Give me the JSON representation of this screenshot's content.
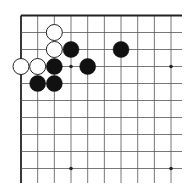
{
  "board": {
    "description": "Go board, top-left corner fragment",
    "origin_x": 21,
    "origin_y": 15.5,
    "spacing_x": 16.67,
    "spacing_y": 17,
    "cols": 10,
    "rows": 10,
    "line_extend_right": 182,
    "line_extend_bottom": 183,
    "line_color": "#555555",
    "edge_color": "#222222",
    "star_points": [
      [
        3,
        3
      ],
      [
        9,
        3
      ],
      [
        3,
        9
      ],
      [
        9,
        9
      ]
    ],
    "stone_radius": 8,
    "stones": [
      {
        "color": "white",
        "col": 2,
        "row": 1
      },
      {
        "color": "white",
        "col": 2,
        "row": 2
      },
      {
        "color": "black",
        "col": 3,
        "row": 2
      },
      {
        "color": "black",
        "col": 6,
        "row": 2
      },
      {
        "color": "white",
        "col": 0,
        "row": 3
      },
      {
        "color": "white",
        "col": 1,
        "row": 3
      },
      {
        "color": "black",
        "col": 2,
        "row": 3
      },
      {
        "color": "black",
        "col": 4,
        "row": 3
      },
      {
        "color": "black",
        "col": 1,
        "row": 4
      },
      {
        "color": "black",
        "col": 2,
        "row": 4
      }
    ],
    "colors": {
      "black_stone": "#111111",
      "white_stone": "#ffffff",
      "white_outline": "#222222"
    }
  }
}
